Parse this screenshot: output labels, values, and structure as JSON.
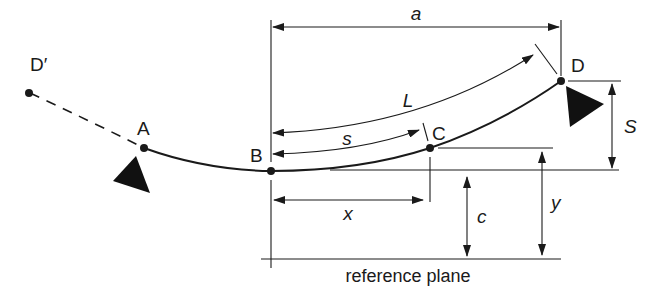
{
  "diagram": {
    "points": {
      "d_prime": "D′",
      "a": "A",
      "b": "B",
      "c": "C",
      "d": "D"
    },
    "dimensions": {
      "a": "a",
      "L": "L",
      "s": "s",
      "S": "S",
      "x": "x",
      "c": "c",
      "y": "y"
    },
    "reference_plane": "reference plane",
    "colors": {
      "ink": "#1a1a1a",
      "background": "#ffffff"
    }
  }
}
